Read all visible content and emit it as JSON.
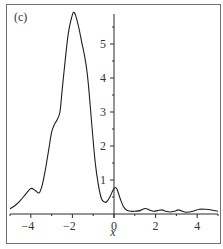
{
  "panel_label": "(c)",
  "chart_data": {
    "type": "line",
    "title": "",
    "panel": "(c)",
    "xlabel": "x",
    "ylabel": "",
    "xlim": [
      -5,
      5
    ],
    "ylim": [
      0,
      6
    ],
    "grid": false,
    "legend": null,
    "x_ticks": [
      -4,
      -2,
      0,
      2,
      4
    ],
    "x_tick_labels": [
      "−4",
      "−2",
      "0",
      "2",
      "4"
    ],
    "x_minor_ticks": [
      -5,
      -3,
      -1,
      1,
      3,
      5
    ],
    "y_ticks": [
      1,
      2,
      3,
      4,
      5
    ],
    "y_tick_labels": [
      "1",
      "2",
      "3",
      "4",
      "5"
    ],
    "y_axis_position_x": 0,
    "series": [
      {
        "name": "curve",
        "color": "#1e1e1e",
        "x": [
          -5.0,
          -4.7,
          -4.5,
          -4.25,
          -4.0,
          -3.8,
          -3.6,
          -3.45,
          -3.3,
          -3.15,
          -3.0,
          -2.85,
          -2.75,
          -2.6,
          -2.5,
          -2.35,
          -2.2,
          -2.05,
          -1.95,
          -1.85,
          -1.7,
          -1.55,
          -1.4,
          -1.3,
          -1.2,
          -1.05,
          -0.9,
          -0.75,
          -0.6,
          -0.45,
          -0.35,
          -0.2,
          -0.05,
          0.05,
          0.15,
          0.3,
          0.45,
          0.6,
          0.8,
          1.0,
          1.25,
          1.5,
          1.7,
          1.9,
          2.1,
          2.3,
          2.5,
          2.7,
          2.9,
          3.1,
          3.3,
          3.5,
          3.8,
          4.1,
          4.4,
          4.7,
          5.0
        ],
        "y": [
          0.15,
          0.28,
          0.4,
          0.58,
          0.75,
          0.7,
          0.62,
          0.85,
          1.3,
          1.85,
          2.4,
          2.65,
          2.75,
          3.0,
          3.6,
          4.5,
          5.3,
          5.75,
          5.93,
          5.85,
          5.5,
          5.05,
          4.6,
          4.2,
          3.6,
          2.5,
          1.5,
          0.85,
          0.45,
          0.35,
          0.36,
          0.5,
          0.7,
          0.78,
          0.72,
          0.45,
          0.22,
          0.12,
          0.08,
          0.08,
          0.1,
          0.16,
          0.12,
          0.08,
          0.1,
          0.12,
          0.08,
          0.06,
          0.08,
          0.12,
          0.08,
          0.05,
          0.08,
          0.14,
          0.14,
          0.12,
          0.08
        ]
      }
    ]
  }
}
